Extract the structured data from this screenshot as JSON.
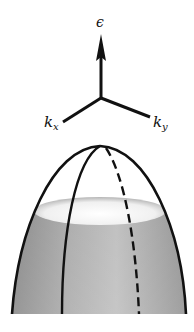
{
  "diagram": {
    "axes": {
      "vertical_label": "ϵ",
      "kx_label": "k",
      "kx_sub": "x",
      "ky_label": "k",
      "ky_sub": "y"
    },
    "surface": {
      "shape": "paraboloid (inverted, downward-opening)",
      "fill_top": "#f4f4f4",
      "fill_side": "#9a9a9a",
      "line_color": "#111111",
      "lines": [
        "outer-left",
        "inner-left",
        "dashed-back",
        "outer-right"
      ]
    }
  }
}
